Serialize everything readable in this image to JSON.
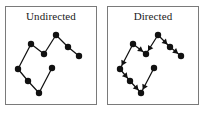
{
  "figure": {
    "name": "undirected-vs-directed-graph-figure",
    "background_color": "#ffffff",
    "border_color": "#7a7a7a",
    "ink_color": "#111111",
    "panels": [
      {
        "id": "undirected",
        "title": "Undirected",
        "arrows": false
      },
      {
        "id": "directed",
        "title": "Directed",
        "arrows": true
      }
    ]
  },
  "chart_data": {
    "type": "diagram",
    "node_radius": 3.2,
    "nodes": [
      {
        "id": "n0",
        "label": "",
        "x": 12,
        "y": 46
      },
      {
        "id": "n1",
        "label": "",
        "x": 25,
        "y": 21
      },
      {
        "id": "n2",
        "label": "",
        "x": 38,
        "y": 31
      },
      {
        "id": "n3",
        "label": "",
        "x": 50,
        "y": 12
      },
      {
        "id": "n4",
        "label": "",
        "x": 62,
        "y": 24
      },
      {
        "id": "n5",
        "label": "",
        "x": 73,
        "y": 33
      },
      {
        "id": "n6",
        "label": "",
        "x": 46,
        "y": 45
      },
      {
        "id": "n7",
        "label": "",
        "x": 22,
        "y": 58
      },
      {
        "id": "n8",
        "label": "",
        "x": 33,
        "y": 70
      }
    ],
    "edges": [
      {
        "from": "n0",
        "to": "n1",
        "directed_from": "n1",
        "directed_to": "n0"
      },
      {
        "from": "n1",
        "to": "n2",
        "directed_from": "n1",
        "directed_to": "n2"
      },
      {
        "from": "n2",
        "to": "n3",
        "directed_from": "n3",
        "directed_to": "n2"
      },
      {
        "from": "n3",
        "to": "n4",
        "directed_from": "n3",
        "directed_to": "n4"
      },
      {
        "from": "n4",
        "to": "n5",
        "directed_from": "n4",
        "directed_to": "n5"
      },
      {
        "from": "n0",
        "to": "n7",
        "directed_from": "n0",
        "directed_to": "n7"
      },
      {
        "from": "n7",
        "to": "n8",
        "directed_from": "n7",
        "directed_to": "n8"
      },
      {
        "from": "n8",
        "to": "n6",
        "directed_from": "n6",
        "directed_to": "n8"
      }
    ],
    "xlabel": "",
    "ylabel": "",
    "grid": false,
    "legend": "none"
  }
}
